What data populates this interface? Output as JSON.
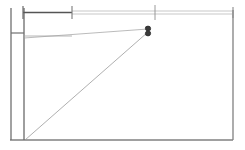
{
  "canvas": {
    "width": 245,
    "height": 150,
    "background": "#ffffff",
    "title": "technical line drawing"
  },
  "colors": {
    "heavy_line": "#555555",
    "medium_line": "#808080",
    "light_line": "#9a9a9a",
    "thin_line": "#aaaaaa",
    "marker_fill": "#3a3a3a",
    "marker_stroke": "#2b2b2b",
    "background": "#ffffff"
  },
  "geometry": {
    "outer_boundary": {
      "name": "room-outline",
      "left_x": 24,
      "right_x": 233,
      "top_y": 10,
      "bottom_y": 140
    },
    "vertical_lines": [
      {
        "name": "outer-wall-line",
        "x": 11,
        "y1": 8,
        "y2": 140,
        "width": 1.3,
        "color": "#707070"
      },
      {
        "name": "inner-wall-line",
        "x": 24,
        "y1": 8,
        "y2": 140,
        "width": 1.3,
        "color": "#6a6a6a"
      },
      {
        "name": "right-edge-line",
        "x": 233,
        "y1": 10,
        "y2": 140,
        "width": 1.3,
        "color": "#808080"
      }
    ],
    "horizontal_lines": [
      {
        "name": "bottom-edge-line",
        "x1": 10,
        "x2": 233,
        "y": 140,
        "width": 1.3,
        "color": "#808080"
      },
      {
        "name": "wall-connector-line",
        "x1": 11,
        "x2": 24,
        "y": 33,
        "width": 1.2,
        "color": "#707070"
      },
      {
        "name": "wall-return-line",
        "x1": 24,
        "x2": 72,
        "y": 36,
        "width": 0.8,
        "color": "#a5a5a5"
      }
    ],
    "dimension_line": {
      "name": "top-dimension-run",
      "y_upper": 11,
      "y_lower": 14,
      "segments": [
        {
          "name": "dimension-segment-heavy",
          "x1": 23,
          "x2": 72,
          "y": 12.5,
          "width": 1.6,
          "color": "#555555"
        },
        {
          "name": "dimension-segment-light-a",
          "x1": 72,
          "x2": 155,
          "y": 11,
          "width": 0.7,
          "color": "#b0b0b0"
        },
        {
          "name": "dimension-segment-light-b",
          "x1": 72,
          "x2": 233,
          "y": 14,
          "width": 0.7,
          "color": "#b0b0b0"
        },
        {
          "name": "dimension-segment-light-c",
          "x1": 155,
          "x2": 233,
          "y": 11,
          "width": 0.7,
          "color": "#b0b0b0"
        }
      ],
      "ticks": [
        {
          "name": "dimension-tick-left",
          "x": 23,
          "y1": 6,
          "y2": 19,
          "width": 1.2,
          "color": "#6a6a6a"
        },
        {
          "name": "dimension-tick-mid",
          "x": 72,
          "y1": 6,
          "y2": 19,
          "width": 1.1,
          "color": "#7a7a7a"
        },
        {
          "name": "dimension-tick-station",
          "x": 155,
          "y1": 5,
          "y2": 20,
          "width": 0.9,
          "color": "#8e8e8e"
        },
        {
          "name": "dimension-tick-right",
          "x": 233,
          "y1": 7,
          "y2": 18,
          "width": 1.1,
          "color": "#8a8a8a"
        }
      ]
    },
    "sight_lines": [
      {
        "name": "upper-sight-line",
        "x1": 24,
        "y1": 38,
        "x2": 148,
        "y2": 29,
        "width": 0.7,
        "color": "#9e9e9e"
      },
      {
        "name": "diagonal-sight-line",
        "x1": 25,
        "y1": 140,
        "x2": 148,
        "y2": 32,
        "width": 0.8,
        "color": "#9a9a9a"
      }
    ],
    "markers": [
      {
        "name": "vertex-marker-upper",
        "cx": 148,
        "cy": 28.5,
        "rx": 2.6,
        "ry": 2.4
      },
      {
        "name": "vertex-marker-lower",
        "cx": 148,
        "cy": 33.5,
        "rx": 2.6,
        "ry": 2.4
      }
    ],
    "marker_stems": [
      {
        "name": "marker-stem-upper",
        "x1": 145,
        "y1": 27,
        "x2": 151,
        "y2": 30,
        "width": 0.7,
        "color": "#555555"
      },
      {
        "name": "marker-stem-lower",
        "x1": 145,
        "y1": 35,
        "x2": 151,
        "y2": 32,
        "width": 0.7,
        "color": "#555555"
      }
    ]
  }
}
